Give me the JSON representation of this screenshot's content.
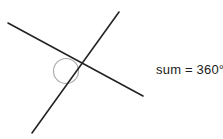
{
  "figure": {
    "background_color": "#ffffff",
    "width": 223,
    "height": 139,
    "line_color": "#242424",
    "line_width": 1.6,
    "arc_color": "#a9a9a9",
    "arc_width": 1.1,
    "vertex": {
      "x": 65,
      "y": 71
    },
    "circle": {
      "cx": 66,
      "cy": 71,
      "r": 12.5
    },
    "lines": [
      {
        "name": "line-upper-left-to-lower-right",
        "x1": 8,
        "y1": 23,
        "x2": 143,
        "y2": 96
      },
      {
        "name": "line-upper-right-to-lower-left",
        "x1": 119,
        "y1": 12,
        "x2": 32,
        "y2": 133
      }
    ],
    "rays": [
      {
        "name": "ray-upper-left",
        "x": 8,
        "y": 23
      },
      {
        "name": "ray-upper-right",
        "x": 119,
        "y": 12
      },
      {
        "name": "ray-lower-right",
        "x": 143,
        "y": 96
      },
      {
        "name": "ray-lower-left",
        "x": 32,
        "y": 133
      }
    ]
  },
  "labels": {
    "sum_text": "sum = 360°"
  }
}
